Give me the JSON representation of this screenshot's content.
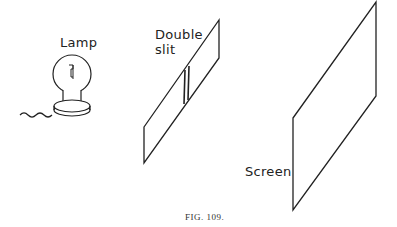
{
  "figure": {
    "caption": "FIG. 109.",
    "labels": {
      "lamp": "Lamp",
      "double_slit_line1": "Double",
      "double_slit_line2": "slit",
      "screen": "Screen"
    }
  }
}
